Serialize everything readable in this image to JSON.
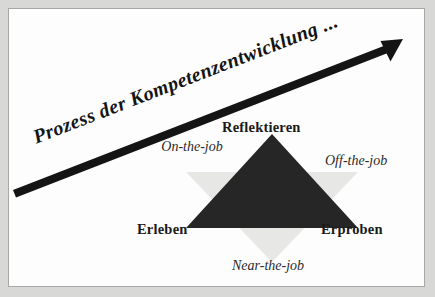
{
  "figure": {
    "headline": "Prozess der Kompetenzentwicklung ...",
    "background_color": "#d8d8d6",
    "panel_color": "#fdfdfd",
    "panel_border_color": "#a8a8a6"
  },
  "arrow": {
    "name": "process-arrow",
    "color": "#141414",
    "direction": "up-right"
  },
  "triangles": {
    "upward": {
      "label": "competence-triangle",
      "color": "#262626"
    },
    "downward": {
      "label": "learning-locations-triangle",
      "color": "#e7e7e5"
    }
  },
  "corner_labels": [
    {
      "id": "reflektieren",
      "text": "Reflektieren"
    },
    {
      "id": "erleben",
      "text": "Erleben"
    },
    {
      "id": "erproben",
      "text": "Erproben"
    }
  ],
  "location_labels": [
    {
      "id": "on-the-job",
      "text": "On-the-job"
    },
    {
      "id": "off-the-job",
      "text": "Off-the-job"
    },
    {
      "id": "near-the-job",
      "text": "Near-the-job"
    }
  ]
}
